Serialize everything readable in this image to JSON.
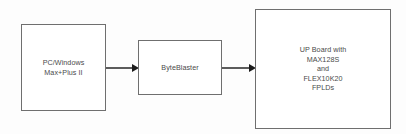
{
  "diagram": {
    "background_color": "#fdfdfd",
    "border_color": "#6f6f6f",
    "text_color": "#4a4a4a",
    "arrow_color": "#1b1b1b",
    "blocks": [
      {
        "id": "pc",
        "label": "PC/Windows\nMax+Plus II",
        "lines": [
          "PC/Windows",
          "Max+Plus II"
        ]
      },
      {
        "id": "byteblaster",
        "label": "ByteBlaster",
        "lines": [
          "ByteBlaster"
        ]
      },
      {
        "id": "upboard",
        "label": "UP Board with\nMAX128S\nand\nFLEX10K20\nFPLDs",
        "lines": [
          "UP Board with",
          "MAX128S",
          "and",
          "FLEX10K20",
          "FPLDs"
        ]
      }
    ],
    "connectors": [
      {
        "id": "pc-to-byteblaster",
        "from": "pc",
        "to": "byteblaster",
        "style": "arrow-right"
      },
      {
        "id": "byteblaster-to-upboard",
        "from": "byteblaster",
        "to": "upboard",
        "style": "arrow-right"
      }
    ]
  }
}
